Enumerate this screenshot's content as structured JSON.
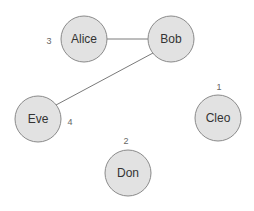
{
  "graph": {
    "nodes": [
      {
        "id": "alice",
        "label": "Alice",
        "badge": "3"
      },
      {
        "id": "bob",
        "label": "Bob",
        "badge": ""
      },
      {
        "id": "cleo",
        "label": "Cleo",
        "badge": "1"
      },
      {
        "id": "don",
        "label": "Don",
        "badge": "2"
      },
      {
        "id": "eve",
        "label": "Eve",
        "badge": "4"
      }
    ],
    "edges": [
      {
        "from": "alice",
        "to": "bob"
      },
      {
        "from": "bob",
        "to": "eve"
      }
    ]
  }
}
